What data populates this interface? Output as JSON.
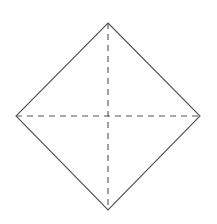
{
  "diagram": {
    "type": "square-with-diagonals",
    "canvas": {
      "width": 217,
      "height": 224,
      "background": "#ffffff"
    },
    "stroke_color": "#555555",
    "vertices": {
      "top": [
        108,
        23
      ],
      "right": [
        200,
        116
      ],
      "bottom": [
        108,
        210
      ],
      "left": [
        16,
        116
      ]
    },
    "solid_edges": [
      {
        "from": "top",
        "to": "right"
      },
      {
        "from": "right",
        "to": "bottom"
      },
      {
        "from": "bottom",
        "to": "left"
      },
      {
        "from": "left",
        "to": "top"
      }
    ],
    "dashed_lines": [
      {
        "name": "vertical-diagonal",
        "from": "top",
        "to": "bottom"
      },
      {
        "name": "horizontal-diagonal",
        "from": "left",
        "to": "right"
      }
    ],
    "dash_pattern": "6 5"
  }
}
